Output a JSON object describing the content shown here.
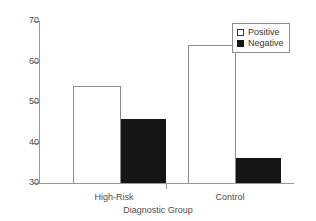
{
  "chart_data": {
    "type": "bar",
    "title": "",
    "subtitle": "",
    "xlabel": "Diagnostic Group",
    "ylabel": "",
    "categories": [
      "High-Risk",
      "Control"
    ],
    "series": [
      {
        "name": "Positive",
        "values": [
          54,
          64
        ],
        "color": "#ffffff"
      },
      {
        "name": "Negative",
        "values": [
          46,
          36.5
        ],
        "color": "#151515"
      }
    ],
    "ylim": [
      30,
      70
    ],
    "yticks": [
      30,
      40,
      50,
      60,
      70
    ],
    "ytick_labels": [
      "30",
      "40",
      "50",
      "60",
      "70"
    ],
    "grid": false,
    "legend_position": "top-right",
    "legend_entries": [
      "Positive",
      "Negative"
    ]
  },
  "axes": {
    "x_axis_name": "x-axis-line",
    "y_axis_name": "y-axis-line"
  }
}
